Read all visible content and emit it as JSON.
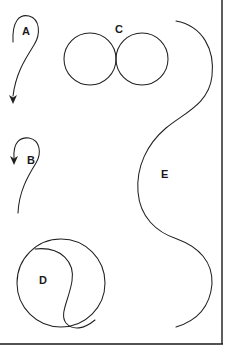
{
  "figure": {
    "background_color": "#ffffff",
    "stroke_color": "#221f1f",
    "frame_color": "#1a1a1a",
    "width": 235,
    "height": 359,
    "labels": [
      {
        "id": "label-a",
        "text": "A",
        "x": 22,
        "y": 26
      },
      {
        "id": "label-b",
        "text": "B",
        "x": 27,
        "y": 155
      },
      {
        "id": "label-c",
        "text": "C",
        "x": 115,
        "y": 24
      },
      {
        "id": "label-d",
        "text": "D",
        "x": 39,
        "y": 275
      },
      {
        "id": "label-e",
        "text": "E",
        "x": 161,
        "y": 169
      }
    ],
    "shapes": [
      {
        "id": "shape-a",
        "name": "curve-a",
        "description": "open curve with upper loop and downward arrow terminus",
        "path": "M 13 42 C 12 20 20 14 29 16 C 40 19 41 34 34 45 C 26 58 16 72 13 96",
        "arrow": {
          "x": 13,
          "y": 103,
          "direction": "down"
        }
      },
      {
        "id": "shape-b",
        "name": "curve-b",
        "description": "open curve with upper loop and downward arrow terminus, tail trailing down",
        "path": "M 14 158 C 13 142 20 137 29 138 C 40 140 42 153 36 163 C 28 176 19 191 18 213",
        "arrow": {
          "x": 14,
          "y": 164,
          "direction": "down"
        }
      },
      {
        "id": "shape-c",
        "name": "tangent-circles-c",
        "description": "two externally tangent circles",
        "circles": [
          {
            "cx": 90,
            "cy": 59,
            "r": 26
          },
          {
            "cx": 142,
            "cy": 59,
            "r": 26
          }
        ]
      },
      {
        "id": "shape-d",
        "name": "circle-with-s-curve-d",
        "description": "circle divided by an internal S shaped curve",
        "circle": {
          "cx": 61,
          "cy": 283,
          "r": 44
        },
        "inner_path": "M 35 249 C 62 246 75 263 72 281 C 69 300 59 314 66 323 C 73 331 84 329 95 320"
      },
      {
        "id": "shape-e",
        "name": "large-s-curve-e",
        "description": "large open S shaped curve spanning the figure height",
        "path": "M 176 21 C 203 26 215 50 212 76 C 209 104 184 113 166 128 C 147 144 136 167 138 192 C 140 217 156 232 177 239 C 199 247 213 262 212 284 C 210 307 196 321 176 327"
      }
    ],
    "frame": {
      "right_line": {
        "x1": 222,
        "y1": 0,
        "x2": 222,
        "y2": 344
      },
      "bottom_line": {
        "x1": 0,
        "y1": 344,
        "x2": 223,
        "y2": 344
      }
    }
  }
}
